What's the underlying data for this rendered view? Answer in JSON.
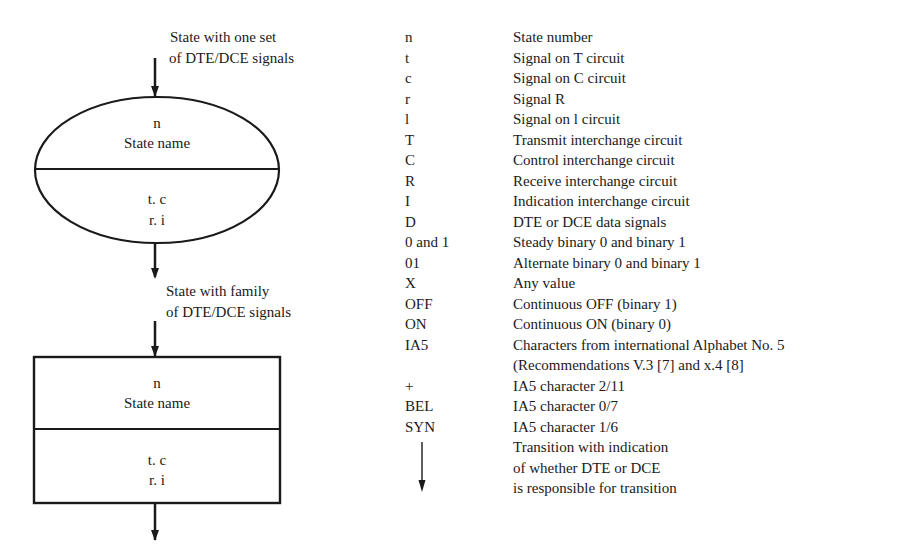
{
  "diagram": {
    "ellipse_state": {
      "caption_line1": "State with one set",
      "caption_line2": "of DTE/DCE signals",
      "top_line1": "n",
      "top_line2": "State name",
      "bottom_line1": "t. c",
      "bottom_line2": "r. i"
    },
    "rect_state": {
      "caption_line1": "State with family",
      "caption_line2": "of DTE/DCE signals",
      "top_line1": "n",
      "top_line2": "State name",
      "bottom_line1": "t. c",
      "bottom_line2": "r. i"
    },
    "stroke_color": "#1a1a1a"
  },
  "legend": {
    "rows": [
      {
        "symbol": "n",
        "description": "State number"
      },
      {
        "symbol": "t",
        "description": "Signal on T circuit"
      },
      {
        "symbol": "c",
        "description": "Signal on C circuit"
      },
      {
        "symbol": "r",
        "description": "Signal R"
      },
      {
        "symbol": "l",
        "description": "Signal on l circuit"
      },
      {
        "symbol": "T",
        "description": "Transmit interchange circuit"
      },
      {
        "symbol": "C",
        "description": "Control interchange circuit"
      },
      {
        "symbol": "R",
        "description": "Receive interchange circuit"
      },
      {
        "symbol": "I",
        "description": "Indication interchange circuit"
      },
      {
        "symbol": "D",
        "description": "DTE or DCE data signals"
      },
      {
        "symbol": "0 and 1",
        "description": "Steady binary 0 and binary 1"
      },
      {
        "symbol": "01",
        "description": "Alternate binary 0 and binary 1"
      },
      {
        "symbol": "X",
        "description": "Any value"
      },
      {
        "symbol": "OFF",
        "description": "Continuous OFF (binary 1)"
      },
      {
        "symbol": "ON",
        "description": "Continuous ON (binary 0)"
      },
      {
        "symbol": "IA5",
        "description": "Characters from international Alphabet No. 5"
      },
      {
        "symbol": "",
        "description": "(Recommendations V.3 [7] and x.4 [8]"
      },
      {
        "symbol": "+",
        "description": "IA5 character 2/11"
      },
      {
        "symbol": "BEL",
        "description": "IA5 character 0/7"
      },
      {
        "symbol": "SYN",
        "description": "IA5 character 1/6"
      },
      {
        "symbol": "arrow-down",
        "description": "Transition with indication"
      },
      {
        "symbol": "",
        "description": "of whether DTE or DCE"
      },
      {
        "symbol": "",
        "description": "is responsible for transition"
      }
    ]
  }
}
